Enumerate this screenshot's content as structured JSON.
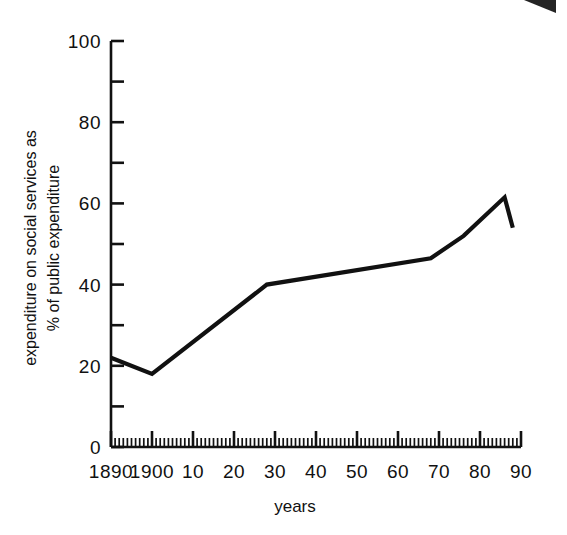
{
  "chart_data": {
    "type": "line",
    "title": "",
    "xlabel": "years",
    "ylabel": "expenditure on social services as % of public expenditure",
    "ylabel_line1": "expenditure on social services as",
    "ylabel_line2": "% of public expenditure",
    "xlim": [
      1890,
      1990
    ],
    "ylim": [
      0,
      100
    ],
    "grid": false,
    "legend": null,
    "y_ticks_major": [
      0,
      20,
      40,
      60,
      80,
      100
    ],
    "y_ticks_minor": [
      10,
      30,
      50,
      70,
      90
    ],
    "y_tick_labels": [
      "0",
      "20",
      "40",
      "60",
      "80",
      "100"
    ],
    "x_ticks_major": [
      1890,
      1900,
      1910,
      1920,
      1930,
      1940,
      1950,
      1960,
      1970,
      1980,
      1990
    ],
    "x_tick_labels": [
      "1890",
      "1900",
      "10",
      "20",
      "30",
      "40",
      "50",
      "60",
      "70",
      "80",
      "90"
    ],
    "x_minor_tick_interval": 1,
    "series": [
      {
        "name": "expenditure on social services",
        "color": "#111111",
        "x": [
          1890,
          1900,
          1928,
          1968,
          1976,
          1986,
          1988
        ],
        "values": [
          22,
          18,
          40,
          46.5,
          52,
          61.5,
          54
        ]
      }
    ]
  },
  "figure": {
    "artifact_name": "scan-artifact-corner"
  }
}
